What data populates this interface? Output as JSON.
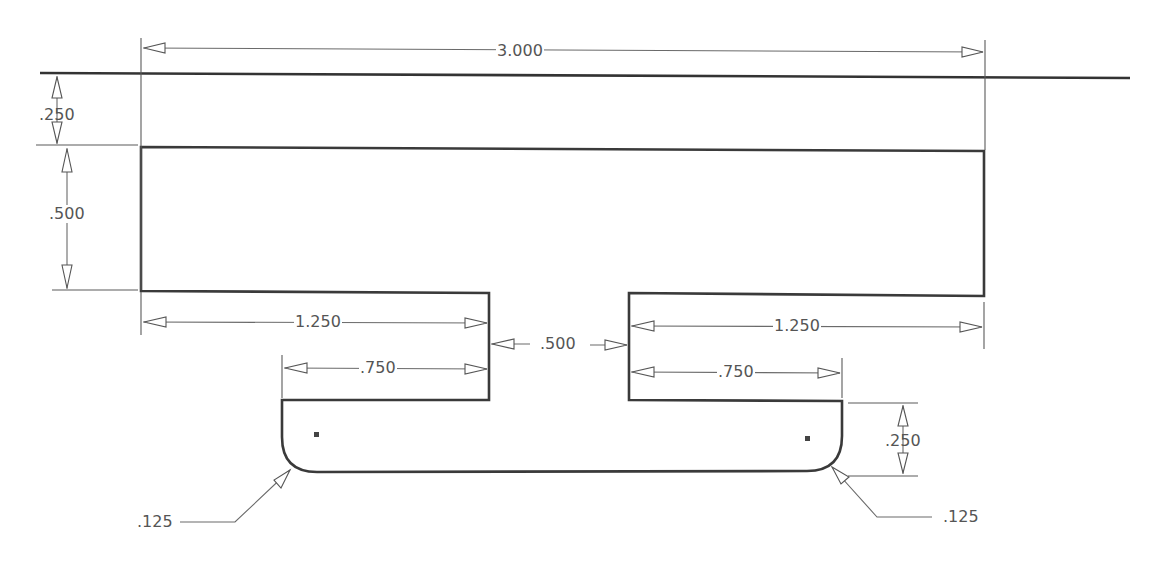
{
  "drawing": {
    "type": "technical-dimensioned-drawing",
    "units": "inches",
    "dimensions": {
      "overall_width": "3.000",
      "top_offset": ".250",
      "block_height": ".500",
      "left_shoulder_width": "1.250",
      "left_leg_width": ".750",
      "slot_width": ".500",
      "right_shoulder_width": "1.250",
      "right_leg_width": ".750",
      "tab_height": ".250",
      "left_fillet_radius": ".125",
      "right_fillet_radius": ".125"
    },
    "colors": {
      "outline": "#3a3a3a",
      "dimension_line": "#6a6a6a",
      "text": "#555555",
      "background": "#ffffff"
    }
  }
}
